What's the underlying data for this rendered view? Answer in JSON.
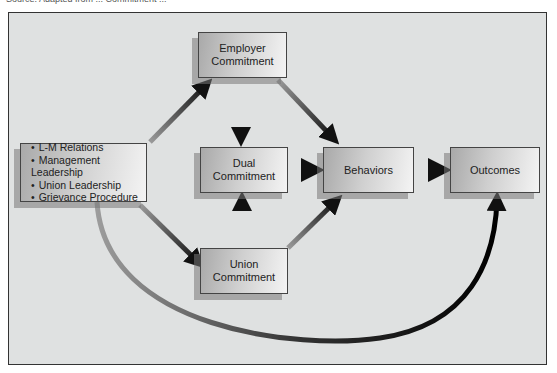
{
  "caption": "Source: Adapted from ... Commitment ...",
  "diagram": {
    "factors_box": {
      "items": [
        "L-M Relations",
        "Management Leadership",
        "Union Leadership",
        "Grievance Procedure"
      ]
    },
    "nodes": {
      "employer": {
        "line1": "Employer",
        "line2": "Commitment"
      },
      "dual": {
        "line1": "Dual",
        "line2": "Commitment"
      },
      "union": {
        "line1": "Union",
        "line2": "Commitment"
      },
      "behaviors": {
        "label": "Behaviors"
      },
      "outcomes": {
        "label": "Outcomes"
      }
    },
    "edges": [
      {
        "from": "factors",
        "to": "employer"
      },
      {
        "from": "factors",
        "to": "union"
      },
      {
        "from": "factors",
        "to": "outcomes",
        "style": "curved"
      },
      {
        "from": "employer",
        "to": "dual"
      },
      {
        "from": "employer",
        "to": "behaviors"
      },
      {
        "from": "union",
        "to": "dual"
      },
      {
        "from": "union",
        "to": "behaviors"
      },
      {
        "from": "dual",
        "to": "behaviors"
      },
      {
        "from": "behaviors",
        "to": "outcomes"
      }
    ],
    "colors": {
      "background": "#dfe1e1",
      "arrow": "#1a1a1a",
      "border": "#333333"
    }
  }
}
